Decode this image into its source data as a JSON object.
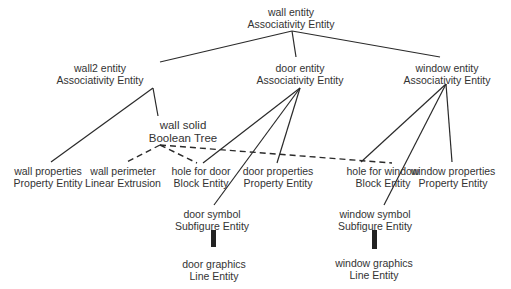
{
  "diagram": {
    "type": "tree",
    "line_color": "#2a2a2a",
    "text_color": "#333333",
    "nodes": {
      "wall": {
        "name": "wall entity",
        "type": "Associativity Entity"
      },
      "wall2": {
        "name": "wall2 entity",
        "type": "Associativity Entity"
      },
      "door": {
        "name": "door entity",
        "type": "Associativity Entity"
      },
      "window": {
        "name": "window entity",
        "type": "Associativity Entity"
      },
      "wall_solid": {
        "name": "wall solid",
        "type": "Boolean Tree"
      },
      "wall_properties": {
        "name": "wall properties",
        "type": "Property Entity"
      },
      "wall_perimeter": {
        "name": "wall perimeter",
        "type": "Linear Extrusion"
      },
      "hole_door": {
        "name": "hole for door",
        "type": "Block Entity"
      },
      "door_properties": {
        "name": "door properties",
        "type": "Property Entity"
      },
      "hole_window": {
        "name": "hole for window",
        "type": "Block Entity"
      },
      "window_properties": {
        "name": "window properties",
        "type": "Property Entity"
      },
      "door_symbol": {
        "name": "door symbol",
        "type": "Subfigure Entity"
      },
      "window_symbol": {
        "name": "window symbol",
        "type": "Subfigure Entity"
      },
      "door_graphics": {
        "name": "door graphics",
        "type": "Line Entity"
      },
      "window_graphics": {
        "name": "window graphics",
        "type": "Line Entity"
      }
    },
    "edges": [
      {
        "from": "wall",
        "to": "wall2",
        "style": "solid"
      },
      {
        "from": "wall",
        "to": "door",
        "style": "solid"
      },
      {
        "from": "wall",
        "to": "window",
        "style": "solid"
      },
      {
        "from": "wall2",
        "to": "wall_properties",
        "style": "solid"
      },
      {
        "from": "wall2",
        "to": "wall_solid",
        "style": "solid"
      },
      {
        "from": "wall_solid",
        "to": "wall_perimeter",
        "style": "dashed"
      },
      {
        "from": "wall_solid",
        "to": "hole_door",
        "style": "dashed"
      },
      {
        "from": "wall_solid",
        "to": "hole_window",
        "style": "dashed"
      },
      {
        "from": "door",
        "to": "hole_door",
        "style": "solid"
      },
      {
        "from": "door",
        "to": "door_properties",
        "style": "solid"
      },
      {
        "from": "door",
        "to": "door_symbol",
        "style": "solid"
      },
      {
        "from": "window",
        "to": "hole_window",
        "style": "solid"
      },
      {
        "from": "window",
        "to": "window_properties",
        "style": "solid"
      },
      {
        "from": "window",
        "to": "window_symbol",
        "style": "solid"
      },
      {
        "from": "door_symbol",
        "to": "door_graphics",
        "style": "thick-bar"
      },
      {
        "from": "window_symbol",
        "to": "window_graphics",
        "style": "thick-bar"
      }
    ]
  }
}
